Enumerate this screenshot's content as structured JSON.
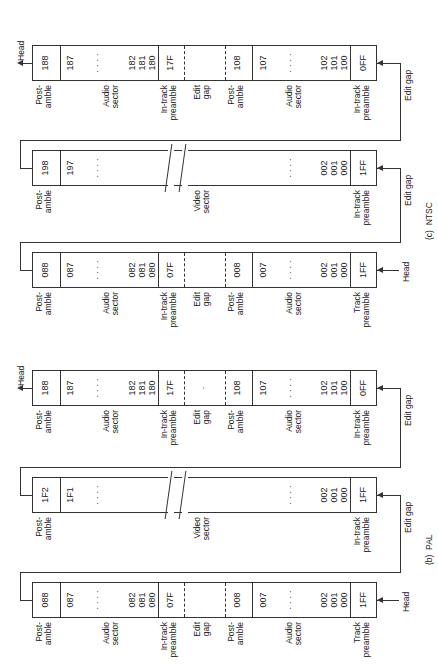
{
  "figure": {
    "captions": {
      "ntsc": "(c)  NTSC",
      "pal": "(b)  PAL"
    },
    "markers": {
      "head": "Head",
      "edit_gap": "Edit gap"
    }
  },
  "ntsc": {
    "row1": {
      "cells": [
        "188",
        "187",
        "· · · ·",
        "182\n181\n180",
        "17F",
        "",
        "108",
        "107",
        "· · · ·",
        "102\n101\n100",
        "0FF"
      ],
      "labels": [
        "Post-\namble",
        "Audio\nsector",
        "In-track\npreamble",
        "Edit\ngap",
        "Post-\namble",
        "Audio\nsector",
        "In-track\npreamble"
      ]
    },
    "row2": {
      "cells": [
        "198",
        "197",
        "· · · ·",
        "· · · ·",
        "002\n001\n000",
        "1FF"
      ],
      "labels": [
        "Post-\namble",
        "Video\nsector",
        "In-track\npreamble"
      ]
    },
    "row3": {
      "cells": [
        "088",
        "087",
        "· · · ·",
        "082\n081\n080",
        "07F",
        "",
        "008",
        "007",
        "· · · ·",
        "002\n001\n000",
        "1FF"
      ],
      "labels": [
        "Post-\namble",
        "Audio\nsector",
        "In-track\npreamble",
        "Edit\ngap",
        "Post-\namble",
        "Audio\nsector",
        "Track\npreamble"
      ]
    }
  },
  "pal": {
    "row1": {
      "cells": [
        "188",
        "187",
        "· · · ·",
        "182\n181\n180",
        "17F",
        "·",
        "108",
        "107",
        "· · · ·",
        "102\n101\n100",
        "0FF"
      ],
      "labels": [
        "Post-\namble",
        "Audio\nsector",
        "In-track\npreamble",
        "Edit\ngap",
        "Post-\namble",
        "Audio\nsector",
        "In-track\npreamble"
      ]
    },
    "row2": {
      "cells": [
        "1F2",
        "1F1",
        "· · · ·",
        "· · · ·",
        "002\n001\n000",
        "1FF"
      ],
      "labels": [
        "Post-\namble",
        "Video\nsector",
        "In-track\npreamble"
      ]
    },
    "row3": {
      "cells": [
        "088",
        "087",
        "· · · ·",
        "082\n081\n080",
        "07F",
        "",
        "008",
        "007",
        "· · · ·",
        "002\n001\n000",
        "1FF"
      ],
      "labels": [
        "Post-\namble",
        "Audio\nsector",
        "In-track\npreamble",
        "Edit\ngap",
        "Post-\namble",
        "Audio\nsector",
        "Track\npreamble"
      ]
    }
  }
}
